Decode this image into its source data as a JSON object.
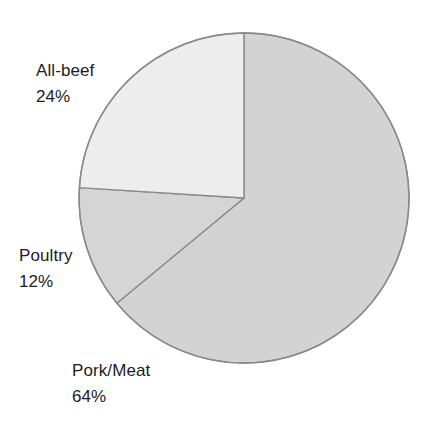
{
  "chart_data": {
    "type": "pie",
    "title": "",
    "subtitle": "",
    "xlabel": "",
    "ylabel": "",
    "legend_position": "none",
    "grid": false,
    "start_angle_deg": 0,
    "direction": "clockwise",
    "center": {
      "x": 244,
      "y": 198
    },
    "radius": 165,
    "categories": [
      "Pork/Meat",
      "Poultry",
      "All-beef"
    ],
    "values": [
      64,
      12,
      24
    ],
    "value_unit": "%",
    "labels": [
      "Pork/Meat 64%",
      "Poultry 12%",
      "All-beef 24%"
    ],
    "slices": [
      {
        "name": "Pork/Meat",
        "value": 64,
        "value_label": "64%",
        "fill": "#d3d3d3",
        "stroke": "#8a8a8a",
        "start_angle_deg": 0,
        "end_angle_deg": 230.4
      },
      {
        "name": "Poultry",
        "value": 12,
        "value_label": "12%",
        "fill": "#d5d5d5",
        "stroke": "#8a8a8a",
        "start_angle_deg": 230.4,
        "end_angle_deg": 273.6
      },
      {
        "name": "All-beef",
        "value": 24,
        "value_label": "24%",
        "fill": "#ededed",
        "stroke": "#8a8a8a",
        "start_angle_deg": 273.6,
        "end_angle_deg": 360
      }
    ]
  },
  "labels": {
    "all_beef": {
      "name": "All-beef",
      "value": "24%"
    },
    "poultry": {
      "name": "Poultry",
      "value": "12%"
    },
    "pork_meat": {
      "name": "Pork/Meat",
      "value": "64%"
    }
  },
  "colors": {
    "background": "#ffffff",
    "text": "#1c1c1c",
    "slice_all_beef": "#ededed",
    "slice_poultry": "#d5d5d5",
    "slice_pork_meat": "#d3d3d3",
    "outline": "#8a8a8a"
  }
}
